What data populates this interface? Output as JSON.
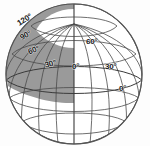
{
  "figure": {
    "kind": "globe-graticule-diagram",
    "title": "",
    "sphere": {
      "center_x": 74,
      "center_y": 74,
      "radius_x": 68,
      "radius_y": 70,
      "outline_color": "#555555",
      "fill_color": "#ffffff"
    },
    "shading": {
      "fill_color": "#9a9a9a",
      "description": "shaded quadrant of upper-left hemisphere between polar cap and mid latitude"
    },
    "polar_cap": {
      "fill_color": "#ffffff",
      "description": "white polar cap region around north pole"
    },
    "grid": {
      "line_color": "#4a4a4a",
      "meridian_count": 12,
      "parallel_count": 5
    }
  },
  "labels": [
    {
      "text": "120°",
      "x": 16,
      "y": 21,
      "rotate": -32,
      "name": "label-120"
    },
    {
      "text": "90°",
      "x": 19,
      "y": 35,
      "rotate": -28,
      "name": "label-90-left"
    },
    {
      "text": "60°",
      "x": 27,
      "y": 49,
      "rotate": -22,
      "name": "label-60-left"
    },
    {
      "text": "30°",
      "x": 44,
      "y": 62,
      "rotate": -14,
      "name": "label-30-left"
    },
    {
      "text": "60°",
      "x": 86,
      "y": 38,
      "rotate": 0,
      "name": "label-60-upper"
    },
    {
      "text": "0°",
      "x": 72,
      "y": 63,
      "rotate": 0,
      "name": "label-0-center"
    },
    {
      "text": "30°",
      "x": 105,
      "y": 63,
      "rotate": 0,
      "name": "label-30-right"
    },
    {
      "text": "0°",
      "x": 119,
      "y": 85,
      "rotate": 0,
      "name": "label-0-right"
    }
  ],
  "chart_data": {
    "type": "scatter",
    "xlabel": "longitude",
    "ylabel": "latitude",
    "categories": [
      "120°",
      "90°",
      "60°",
      "30°",
      "0°",
      "30°",
      "60°",
      "0°"
    ],
    "values": [
      120,
      90,
      60,
      30,
      0,
      30,
      60,
      0
    ],
    "annotations": [
      "120°",
      "90°",
      "60°",
      "30°",
      "60°",
      "0°",
      "30°",
      "0°"
    ]
  }
}
